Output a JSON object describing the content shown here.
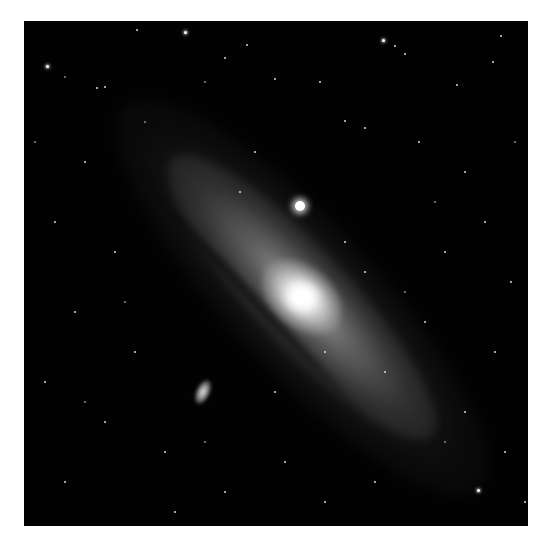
{
  "image": {
    "subject": "spiral galaxy with two companion satellite galaxies in a star field",
    "colors": {
      "background_page": "#ffffff",
      "sky": "#020202",
      "core": "#ffffff",
      "disk": "#a0a0a0"
    },
    "features": [
      {
        "name": "galaxy-core",
        "x": 278,
        "y": 276
      },
      {
        "name": "companion-compact",
        "x": 276,
        "y": 185
      },
      {
        "name": "companion-elliptical",
        "x": 179,
        "y": 371
      }
    ]
  }
}
